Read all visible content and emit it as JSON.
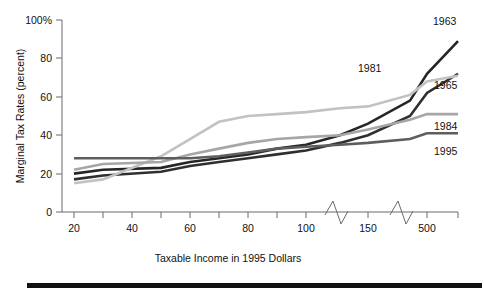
{
  "chart_data": {
    "type": "line",
    "title": "",
    "subtitle": "",
    "xlabel": "Taxable Income in 1995 Dollars",
    "ylabel": "Marginal Tax Rates (percent)",
    "xlim": [
      10,
      700
    ],
    "ylim": [
      0,
      100
    ],
    "grid": false,
    "legend_position": "inline-right-end-labels",
    "x_tick_labels": [
      "20",
      "40",
      "60",
      "80",
      "100",
      "150",
      "500"
    ],
    "x_minor_ticks": true,
    "axis_breaks": [
      "between 100 and 150",
      "between 150 and 500"
    ],
    "y_tick_labels": [
      "0",
      "20",
      "40",
      "60",
      "80",
      "100%"
    ],
    "y_ticks": [
      0,
      20,
      40,
      60,
      80,
      100
    ],
    "x_axis_note": "Thousands of dollars of taxable income, broken scale",
    "categories": [
      "20",
      "30",
      "50",
      "60",
      "70",
      "80",
      "90",
      "100",
      "125",
      "150",
      "300",
      "500",
      "700"
    ],
    "series": [
      {
        "name": "1963",
        "label": "1963",
        "color": "#262626",
        "values": [
          20,
          22,
          23,
          26,
          28,
          30,
          33,
          35,
          40,
          46,
          58,
          72,
          89
        ]
      },
      {
        "name": "1965",
        "label": "1965",
        "color": "#2f2f2f",
        "values": [
          17,
          19,
          21,
          24,
          26,
          28,
          30,
          32,
          36,
          40,
          50,
          62,
          72
        ]
      },
      {
        "name": "1981",
        "label": "1981",
        "color": "#c2c2c2",
        "values": [
          15,
          17,
          29,
          38,
          47,
          50,
          51,
          52,
          54,
          55,
          61,
          68,
          71
        ]
      },
      {
        "name": "1984",
        "label": "1984",
        "color": "#a6a6a6",
        "values": [
          22,
          25,
          26,
          30,
          33,
          36,
          38,
          39,
          40,
          43,
          48,
          51,
          51
        ]
      },
      {
        "name": "1995",
        "label": "1995",
        "color": "#5e5e5e",
        "values": [
          28,
          28,
          28,
          28,
          29,
          31,
          33,
          34,
          35,
          36,
          38,
          41,
          41
        ]
      }
    ],
    "series_end_labels": [
      {
        "label": "1963",
        "x_px": 433,
        "y_px": 25
      },
      {
        "label": "1981",
        "x_px": 358,
        "y_px": 72
      },
      {
        "label": "1965",
        "x_px": 434,
        "y_px": 89
      },
      {
        "label": "1984",
        "x_px": 434,
        "y_px": 130
      },
      {
        "label": "1995",
        "x_px": 434,
        "y_px": 155
      }
    ]
  },
  "figure": {
    "background_color": "#ffffff",
    "axis_color": "#6b6b6b",
    "footer_rule_color": "#111111"
  }
}
